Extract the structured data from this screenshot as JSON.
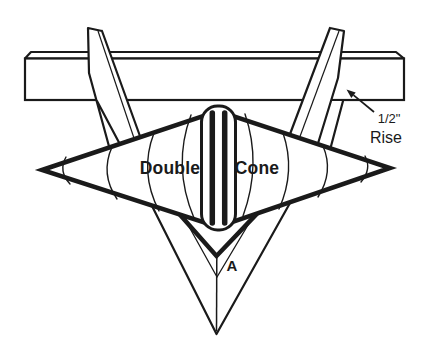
{
  "diagram": {
    "labels": {
      "left_cone": "Double",
      "right_cone": "Cone",
      "vertex": "A",
      "rise_value": "1/2\"",
      "rise_word": "Rise"
    },
    "icons": {
      "rise_arrow": "arrow-up-left"
    },
    "colors": {
      "ink": "#1a1a1a",
      "background": "#ffffff"
    }
  }
}
